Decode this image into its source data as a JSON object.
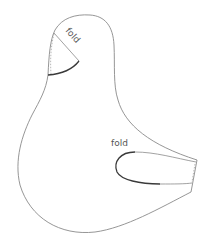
{
  "diagram": {
    "type": "sewing-pattern",
    "shape": "bird-body-piece",
    "labels": {
      "head_fold": "fold",
      "wing_fold": "fold"
    },
    "colors": {
      "background": "#ffffff",
      "outline": "#8a8a8a",
      "fold_edge": "#3a3a3a",
      "text": "#555555"
    }
  }
}
